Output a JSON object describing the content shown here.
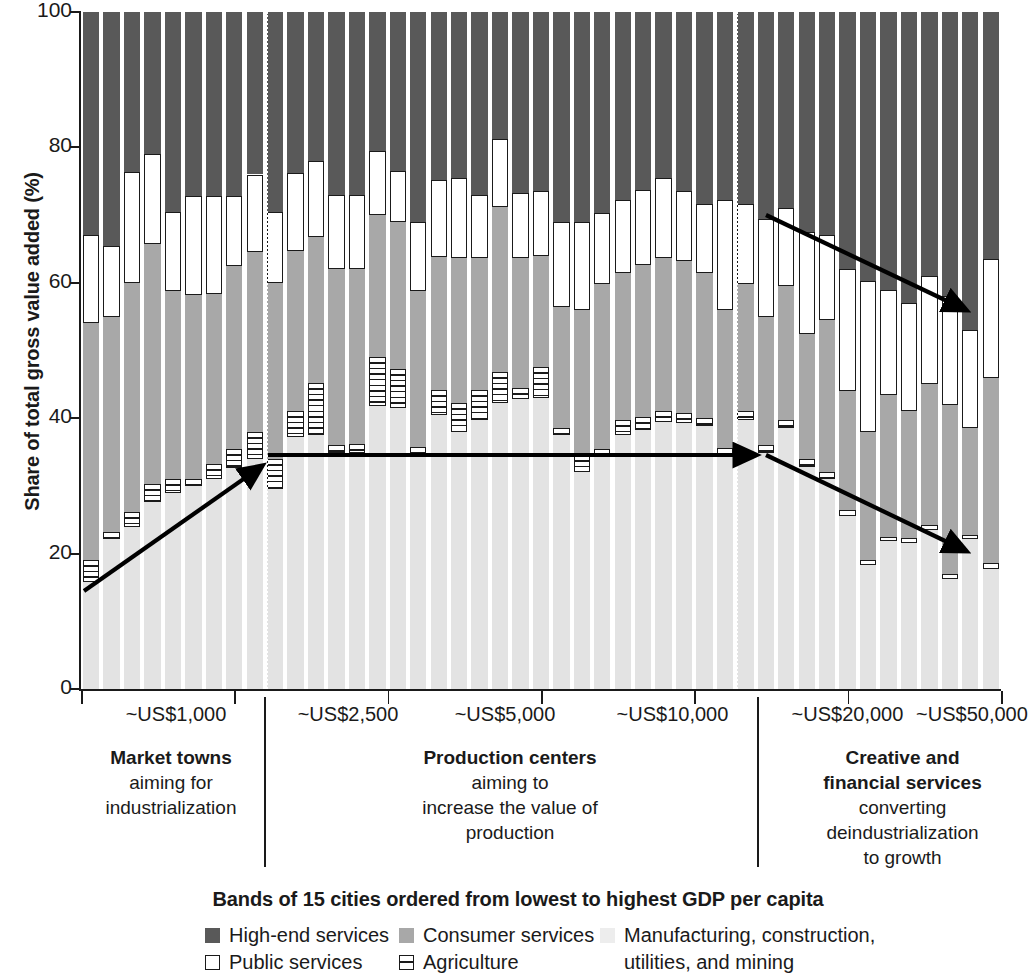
{
  "chart": {
    "type": "bar",
    "ylabel": "Share of total gross value added (%)",
    "caption": "Bands of 15 cities ordered from lowest to highest GDP per capita",
    "ylim": [
      0,
      100
    ],
    "yticks": [
      "0",
      "20",
      "40",
      "60",
      "80",
      "100"
    ],
    "xcats": [
      "~US$1,000",
      "~US$2,500",
      "~US$5,000",
      "~US$10,000",
      "~US$20,000",
      "~US$50,000"
    ],
    "groups": [
      {
        "bold": "Market towns",
        "lines": [
          "aiming for",
          "industrialization"
        ]
      },
      {
        "bold": "Production centers",
        "lines": [
          "aiming to",
          "increase the value of",
          "production"
        ]
      },
      {
        "bold": "Creative and",
        "bold2": "financial services",
        "lines": [
          "converting",
          "deindustrialization",
          "to growth"
        ]
      }
    ],
    "legend": [
      {
        "key": "high",
        "label": "High-end services"
      },
      {
        "key": "pub",
        "label": "Public services"
      },
      {
        "key": "cons",
        "label": "Consumer services"
      },
      {
        "key": "agri",
        "label": "Agriculture"
      },
      {
        "key": "manu",
        "label": "Manufacturing, construction,"
      },
      {
        "key": "manu2",
        "label": "utilities, and mining"
      }
    ],
    "series_order": [
      "manufacturing",
      "agriculture",
      "consumer",
      "public",
      "highend"
    ],
    "series_colors": {
      "highend": "#595959",
      "public": "#ffffff",
      "consumer": "#a8a8a8",
      "agriculture": "#ffffff",
      "manufacturing": "#e3e3e3"
    },
    "bars": [
      {
        "agri_lo": 15.8,
        "agri_hi": 19.0,
        "cons_lo": 19.0,
        "cons_hi": 54.0,
        "pub_lo": 54.0,
        "pub_hi": 67.0
      },
      {
        "agri_lo": 22.2,
        "agri_hi": 23.2,
        "cons_lo": 23.2,
        "cons_hi": 55.0,
        "pub_lo": 55.0,
        "pub_hi": 65.5
      },
      {
        "agri_lo": 24.0,
        "agri_hi": 26.2,
        "cons_lo": 26.2,
        "cons_hi": 60.0,
        "pub_lo": 60.0,
        "pub_hi": 76.3
      },
      {
        "agri_lo": 27.6,
        "agri_hi": 30.3,
        "cons_lo": 30.3,
        "cons_hi": 65.8,
        "pub_lo": 65.8,
        "pub_hi": 79.0
      },
      {
        "agri_lo": 29.0,
        "agri_hi": 31.0,
        "cons_lo": 31.0,
        "cons_hi": 58.8,
        "pub_lo": 58.8,
        "pub_hi": 70.5
      },
      {
        "agri_lo": 30.0,
        "agri_hi": 31.0,
        "cons_lo": 31.0,
        "cons_hi": 58.2,
        "pub_lo": 58.2,
        "pub_hi": 72.8
      },
      {
        "agri_lo": 31.0,
        "agri_hi": 33.2,
        "cons_lo": 33.2,
        "cons_hi": 58.4,
        "pub_lo": 58.4,
        "pub_hi": 72.8
      },
      {
        "agri_lo": 32.7,
        "agri_hi": 35.5,
        "cons_lo": 35.5,
        "cons_hi": 62.5,
        "pub_lo": 62.5,
        "pub_hi": 72.8
      },
      {
        "agri_lo": 34.0,
        "agri_hi": 38.0,
        "cons_lo": 38.0,
        "cons_hi": 64.5,
        "pub_lo": 64.5,
        "pub_hi": 76.0
      },
      {
        "agri_lo": 29.5,
        "agri_hi": 34.0,
        "cons_lo": 34.0,
        "cons_hi": 60.0,
        "pub_lo": 60.0,
        "pub_hi": 70.5
      },
      {
        "agri_lo": 37.2,
        "agri_hi": 41.0,
        "cons_lo": 41.0,
        "cons_hi": 64.7,
        "pub_lo": 64.7,
        "pub_hi": 76.2
      },
      {
        "agri_lo": 37.5,
        "agri_hi": 45.2,
        "cons_lo": 45.2,
        "cons_hi": 66.8,
        "pub_lo": 66.8,
        "pub_hi": 78.0
      },
      {
        "agri_lo": 34.9,
        "agri_hi": 36.0,
        "cons_lo": 36.0,
        "cons_hi": 62.0,
        "pub_lo": 62.0,
        "pub_hi": 73.0
      },
      {
        "agri_lo": 34.9,
        "agri_hi": 36.2,
        "cons_lo": 36.2,
        "cons_hi": 62.0,
        "pub_lo": 62.0,
        "pub_hi": 73.0
      },
      {
        "agri_lo": 41.8,
        "agri_hi": 49.0,
        "cons_lo": 49.0,
        "cons_hi": 70.0,
        "pub_lo": 70.0,
        "pub_hi": 79.5
      },
      {
        "agri_lo": 41.5,
        "agri_hi": 47.3,
        "cons_lo": 47.3,
        "cons_hi": 69.0,
        "pub_lo": 69.0,
        "pub_hi": 76.5
      },
      {
        "agri_lo": 34.6,
        "agri_hi": 35.8,
        "cons_lo": 35.8,
        "cons_hi": 58.8,
        "pub_lo": 58.8,
        "pub_hi": 69.0
      },
      {
        "agri_lo": 40.5,
        "agri_hi": 44.2,
        "cons_lo": 44.2,
        "cons_hi": 63.8,
        "pub_lo": 63.8,
        "pub_hi": 75.2
      },
      {
        "agri_lo": 38.0,
        "agri_hi": 42.2,
        "cons_lo": 42.2,
        "cons_hi": 63.6,
        "pub_lo": 63.6,
        "pub_hi": 75.5
      },
      {
        "agri_lo": 39.8,
        "agri_hi": 44.2,
        "cons_lo": 44.2,
        "cons_hi": 63.6,
        "pub_lo": 63.6,
        "pub_hi": 73.0
      },
      {
        "agri_lo": 42.3,
        "agri_hi": 46.8,
        "cons_lo": 46.8,
        "cons_hi": 71.2,
        "pub_lo": 71.2,
        "pub_hi": 81.3
      },
      {
        "agri_lo": 42.8,
        "agri_hi": 44.4,
        "cons_lo": 44.4,
        "cons_hi": 63.7,
        "pub_lo": 63.7,
        "pub_hi": 73.2
      },
      {
        "agri_lo": 43.0,
        "agri_hi": 47.5,
        "cons_lo": 47.5,
        "cons_hi": 64.0,
        "pub_lo": 64.0,
        "pub_hi": 73.5
      },
      {
        "agri_lo": 37.5,
        "agri_hi": 38.6,
        "cons_lo": 38.6,
        "cons_hi": 56.5,
        "pub_lo": 56.5,
        "pub_hi": 69.0
      },
      {
        "agri_lo": 32.0,
        "agri_hi": 34.5,
        "cons_lo": 34.5,
        "cons_hi": 56.0,
        "pub_lo": 56.0,
        "pub_hi": 69.0
      },
      {
        "agri_lo": 34.2,
        "agri_hi": 35.5,
        "cons_lo": 35.5,
        "cons_hi": 59.8,
        "pub_lo": 59.8,
        "pub_hi": 70.3
      },
      {
        "agri_lo": 37.5,
        "agri_hi": 39.8,
        "cons_lo": 39.8,
        "cons_hi": 61.5,
        "pub_lo": 61.5,
        "pub_hi": 72.2
      },
      {
        "agri_lo": 38.3,
        "agri_hi": 40.2,
        "cons_lo": 40.2,
        "cons_hi": 62.6,
        "pub_lo": 62.6,
        "pub_hi": 73.7
      },
      {
        "agri_lo": 39.5,
        "agri_hi": 41.0,
        "cons_lo": 41.0,
        "cons_hi": 63.6,
        "pub_lo": 63.6,
        "pub_hi": 75.5
      },
      {
        "agri_lo": 39.3,
        "agri_hi": 40.8,
        "cons_lo": 40.8,
        "cons_hi": 63.2,
        "pub_lo": 63.2,
        "pub_hi": 73.5
      },
      {
        "agri_lo": 38.8,
        "agri_hi": 40.0,
        "cons_lo": 40.0,
        "cons_hi": 61.5,
        "pub_lo": 61.5,
        "pub_hi": 71.6
      },
      {
        "agri_lo": 34.5,
        "agri_hi": 35.6,
        "cons_lo": 35.6,
        "cons_hi": 56.0,
        "pub_lo": 56.0,
        "pub_hi": 72.2
      },
      {
        "agri_lo": 39.8,
        "agri_hi": 41.0,
        "cons_lo": 41.0,
        "cons_hi": 59.8,
        "pub_lo": 59.8,
        "pub_hi": 71.7
      },
      {
        "agri_lo": 34.8,
        "agri_hi": 36.0,
        "cons_lo": 36.0,
        "cons_hi": 55.0,
        "pub_lo": 55.0,
        "pub_hi": 69.5
      },
      {
        "agri_lo": 38.5,
        "agri_hi": 39.7,
        "cons_lo": 39.7,
        "cons_hi": 59.5,
        "pub_lo": 59.5,
        "pub_hi": 71.0
      },
      {
        "agri_lo": 32.8,
        "agri_hi": 34.0,
        "cons_lo": 34.0,
        "cons_hi": 52.5,
        "pub_lo": 52.5,
        "pub_hi": 67.5
      },
      {
        "agri_lo": 31.0,
        "agri_hi": 32.0,
        "cons_lo": 32.0,
        "cons_hi": 54.5,
        "pub_lo": 54.5,
        "pub_hi": 67.0
      },
      {
        "agri_lo": 25.5,
        "agri_hi": 26.5,
        "cons_lo": 26.5,
        "cons_hi": 44.0,
        "pub_lo": 44.0,
        "pub_hi": 62.0
      },
      {
        "agri_lo": 18.3,
        "agri_hi": 19.0,
        "cons_lo": 19.0,
        "cons_hi": 38.0,
        "pub_lo": 38.0,
        "pub_hi": 60.3
      },
      {
        "agri_lo": 21.8,
        "agri_hi": 22.5,
        "cons_lo": 22.5,
        "cons_hi": 43.5,
        "pub_lo": 43.5,
        "pub_hi": 59.0
      },
      {
        "agri_lo": 21.5,
        "agri_hi": 22.3,
        "cons_lo": 22.3,
        "cons_hi": 41.0,
        "pub_lo": 41.0,
        "pub_hi": 57.0
      },
      {
        "agri_lo": 23.5,
        "agri_hi": 24.2,
        "cons_lo": 24.2,
        "cons_hi": 45.0,
        "pub_lo": 45.0,
        "pub_hi": 61.0
      },
      {
        "agri_lo": 16.3,
        "agri_hi": 17.0,
        "cons_lo": 17.0,
        "cons_hi": 42.0,
        "pub_lo": 42.0,
        "pub_hi": 58.0
      },
      {
        "agri_lo": 22.2,
        "agri_hi": 22.8,
        "cons_lo": 22.8,
        "cons_hi": 38.5,
        "pub_lo": 38.5,
        "pub_hi": 53.0
      },
      {
        "agri_lo": 17.8,
        "agri_hi": 18.6,
        "cons_lo": 18.6,
        "cons_hi": 46.0,
        "pub_lo": 46.0,
        "pub_hi": 63.5
      }
    ],
    "annotations": [
      {
        "name": "rising-agriculture-arrow",
        "x1": 84,
        "y1": 591,
        "x2": 262,
        "y2": 466
      },
      {
        "name": "flat-agriculture-arrow",
        "x1": 268,
        "y1": 455,
        "x2": 756,
        "y2": 455
      },
      {
        "name": "declining-services-arrow",
        "x1": 766,
        "y1": 215,
        "x2": 966,
        "y2": 310
      },
      {
        "name": "declining-agriculture-arrow",
        "x1": 766,
        "y1": 455,
        "x2": 966,
        "y2": 551
      }
    ]
  }
}
